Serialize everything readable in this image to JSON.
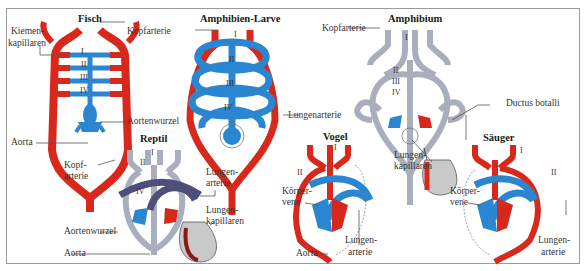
{
  "colors": {
    "oxygenated": "#d8281c",
    "deoxygenated": "#2a86d0",
    "mixed_gray": "#a9aebd",
    "dark_vessel": "#4d4f7a",
    "leader_line": "#555555",
    "border": "#9a9a9a"
  },
  "panels": {
    "fisch": {
      "title": "Fisch",
      "labels": {
        "kiemen": "Kiemen-",
        "kapillaren": "kapillaren",
        "kopfarterie": "Kopfarterie",
        "aortenwurzel": "Aortenwurzel",
        "aorta": "Aorta"
      },
      "arches": [
        "I",
        "II",
        "III",
        "IV"
      ]
    },
    "amphibien_larve": {
      "title": "Amphibien-Larve",
      "labels": {
        "lungenarterie": "Lungenarterie"
      },
      "arches": [
        "I",
        "II",
        "III",
        "IV"
      ]
    },
    "amphibium": {
      "title": "Amphibium",
      "labels": {
        "kopfarterie": "Kopfarterie",
        "ductus_botalli": "Ductus botalli",
        "lungen": "Lungen-",
        "kapillaren": "kapillaren"
      },
      "arches": [
        "I",
        "II",
        "III",
        "IV"
      ]
    },
    "reptil": {
      "title": "Reptil",
      "labels": {
        "kopf": "Kopf-",
        "arterie": "arterie",
        "lungen_a": "Lungen-",
        "lungen_arterie": "arterie",
        "lungen_k": "Lungen-",
        "kapillaren": "kapillaren",
        "aortenwurzel": "Aortenwurzel",
        "aorta": "Aorta"
      },
      "arches": [
        "I",
        "II",
        "IV"
      ]
    },
    "vogel": {
      "title": "Vogel",
      "labels": {
        "koerper": "Körper-",
        "vene": "vene",
        "aorta": "Aorta",
        "lungen": "Lungen-",
        "arterie": "arterie"
      },
      "arches": [
        "I",
        "II"
      ]
    },
    "saeuger": {
      "title": "Säuger",
      "labels": {
        "koerper": "Körper-",
        "vene": "vene",
        "lungen": "Lungen-",
        "arterie": "arterie"
      },
      "arches": [
        "I",
        "II"
      ]
    }
  }
}
